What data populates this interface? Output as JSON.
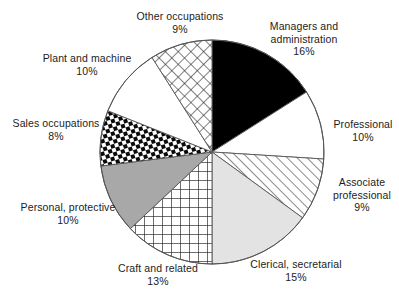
{
  "chart_data": {
    "type": "pie",
    "title": "",
    "subtitle": "",
    "xlabel": "",
    "ylabel": "",
    "legend_position": "none",
    "grid": false,
    "value_unit": "%",
    "start_angle_deg": 0,
    "direction": "clockwise",
    "total": 100,
    "categories": [
      "Managers and administration",
      "Professional",
      "Associate professional",
      "Clerical, secretarial",
      "Craft and related",
      "Personal, protective",
      "Sales occupations",
      "Plant and machine",
      "Other occupations"
    ],
    "values": [
      16,
      10,
      9,
      15,
      13,
      10,
      8,
      10,
      9
    ],
    "slices": [
      {
        "label": "Managers and administration",
        "label_line1": "Managers and",
        "label_line2": "administration",
        "value": 16,
        "value_text": "16%",
        "fill_style": "solid-black",
        "fill_color": "#000000"
      },
      {
        "label": "Professional",
        "label_line1": "Professional",
        "label_line2": "",
        "value": 10,
        "value_text": "10%",
        "fill_style": "solid-white",
        "fill_color": "#ffffff"
      },
      {
        "label": "Associate professional",
        "label_line1": "Associate",
        "label_line2": "professional",
        "value": 9,
        "value_text": "9%",
        "fill_style": "diagonal-hatch",
        "fill_color": "#ffffff"
      },
      {
        "label": "Clerical, secretarial",
        "label_line1": "Clerical, secretarial",
        "label_line2": "",
        "value": 15,
        "value_text": "15%",
        "fill_style": "solid-light-gray",
        "fill_color": "#e3e3e3"
      },
      {
        "label": "Craft and related",
        "label_line1": "Craft and related",
        "label_line2": "",
        "value": 13,
        "value_text": "13%",
        "fill_style": "square-grid",
        "fill_color": "#ffffff"
      },
      {
        "label": "Personal, protective",
        "label_line1": "Personal, protective",
        "label_line2": "",
        "value": 10,
        "value_text": "10%",
        "fill_style": "solid-mid-gray",
        "fill_color": "#a8a8a8"
      },
      {
        "label": "Sales occupations",
        "label_line1": "Sales occupations",
        "label_line2": "",
        "value": 8,
        "value_text": "8%",
        "fill_style": "checkerboard",
        "fill_color": "#000000"
      },
      {
        "label": "Plant and machine",
        "label_line1": "Plant and machine",
        "label_line2": "",
        "value": 10,
        "value_text": "10%",
        "fill_style": "solid-white",
        "fill_color": "#ffffff"
      },
      {
        "label": "Other occupations",
        "label_line1": "Other occupations",
        "label_line2": "",
        "value": 9,
        "value_text": "9%",
        "fill_style": "diagonal-cross-hatch",
        "fill_color": "#ffffff"
      }
    ],
    "geometry": {
      "center_x": 212,
      "center_y": 152,
      "radius": 112
    },
    "outline_color": "#555555"
  }
}
